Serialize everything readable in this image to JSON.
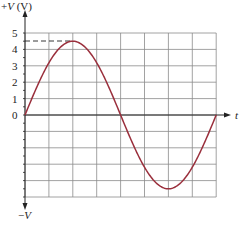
{
  "chart_data": {
    "type": "line",
    "title": "",
    "ylabel": "+V (V)",
    "ylabel_negative": "−V",
    "xlabel": "t",
    "y_ticks": [
      "5",
      "4",
      "3",
      "2",
      "1",
      "0"
    ],
    "ylim": [
      -5,
      5
    ],
    "grid": true,
    "grid_columns": 8,
    "grid_rows_above_zero": 5,
    "grid_rows_below_zero": 5,
    "series": [
      {
        "name": "sine wave",
        "function": "4.5*sin(2*pi*x/8)",
        "amplitude": 4.5,
        "period_grid_units": 8,
        "x": [
          0,
          1,
          2,
          3,
          4,
          5,
          6,
          7,
          8
        ],
        "values": [
          0,
          3.18,
          4.5,
          3.18,
          0,
          -3.18,
          -4.5,
          -3.18,
          0
        ]
      }
    ],
    "annotations": [
      {
        "type": "dashed-line",
        "label": "peak",
        "value": 4.5
      }
    ],
    "colors": {
      "curve": "#9a2f3c",
      "grid": "#8a8a8a",
      "axis": "#222222"
    }
  }
}
